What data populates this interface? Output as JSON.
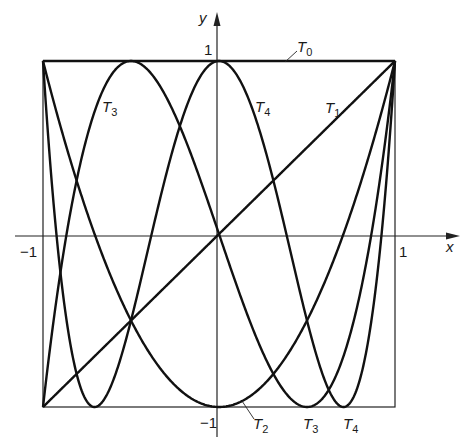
{
  "chart_data": {
    "type": "line",
    "title": "",
    "xlabel": "x",
    "ylabel": "y",
    "xlim": [
      -1,
      1
    ],
    "ylim": [
      -1,
      1
    ],
    "grid": false,
    "frame_box": true,
    "x_ticks": [
      {
        "value": -1,
        "label": "-1"
      },
      {
        "value": 1,
        "label": "1"
      }
    ],
    "y_ticks": [
      {
        "value": 1,
        "label": "1"
      },
      {
        "value": -1,
        "label": "-1"
      }
    ],
    "series": [
      {
        "name": "T0",
        "formula": "1",
        "label_pos": [
          0.45,
          1.12
        ]
      },
      {
        "name": "T1",
        "formula": "x",
        "label_pos": [
          0.62,
          0.58
        ]
      },
      {
        "name": "T2",
        "formula": "2x^2-1",
        "label_pos": [
          0.12,
          -1.12
        ]
      },
      {
        "name": "T3",
        "formula": "4x^3-3x",
        "label_pos": [
          -0.63,
          0.62
        ],
        "label_pos2": [
          0.55,
          -1.12
        ]
      },
      {
        "name": "T4",
        "formula": "8x^4-8x^2+1",
        "label_pos": [
          0.14,
          0.62
        ],
        "label_pos2": [
          0.7,
          -1.12
        ]
      }
    ],
    "sample_points": {
      "x": [
        -1,
        -0.75,
        -0.5,
        -0.25,
        0,
        0.25,
        0.5,
        0.75,
        1
      ],
      "T0": [
        1,
        1,
        1,
        1,
        1,
        1,
        1,
        1,
        1
      ],
      "T1": [
        -1,
        -0.75,
        -0.5,
        -0.25,
        0,
        0.25,
        0.5,
        0.75,
        1
      ],
      "T2": [
        1,
        0.125,
        -0.5,
        -0.875,
        -1,
        -0.875,
        -0.5,
        0.125,
        1
      ],
      "T3": [
        -1,
        0.5625,
        1,
        0.6875,
        0,
        -0.6875,
        -1,
        -0.5625,
        1
      ],
      "T4": [
        1,
        -0.7188,
        -0.5,
        0.5313,
        1,
        0.5313,
        -0.5,
        -0.7188,
        1
      ]
    }
  },
  "labels": {
    "axis_x": "x",
    "axis_y": "y",
    "tick_x_neg": "−1",
    "tick_x_pos": "1",
    "tick_y_pos": "1",
    "tick_y_neg": "−1",
    "T": "T",
    "T0_sub": "0",
    "T1_sub": "1",
    "T2_sub": "2",
    "T3_sub": "3",
    "T4_sub": "4"
  },
  "style": {
    "stroke": "#111111",
    "background": "#ffffff"
  }
}
